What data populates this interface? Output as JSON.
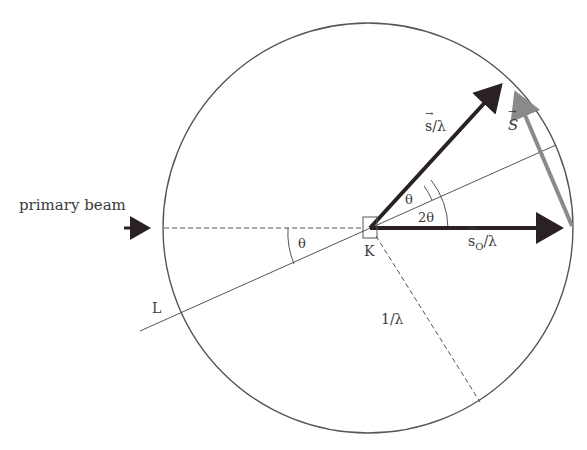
{
  "figure": {
    "type": "Ewald sphere construction",
    "labels": {
      "primary_beam": "primary beam",
      "s_over_lambda": "s/λ",
      "S_vector": "S",
      "theta_upper": "θ",
      "two_theta": "2θ",
      "s0_over_lambda_s": "s",
      "s0_over_lambda_sub": "O",
      "s0_over_lambda_tail": "/λ",
      "origin_K": "K",
      "theta_lower": "θ",
      "line_L": "L",
      "radius": "1/λ"
    },
    "colors": {
      "circle": "#555555",
      "vector_dark": "#2a2222",
      "vector_gray": "#8a8a8a",
      "thin_line": "#555555",
      "dashed": "#555555",
      "text": "#3a3a3a"
    }
  }
}
